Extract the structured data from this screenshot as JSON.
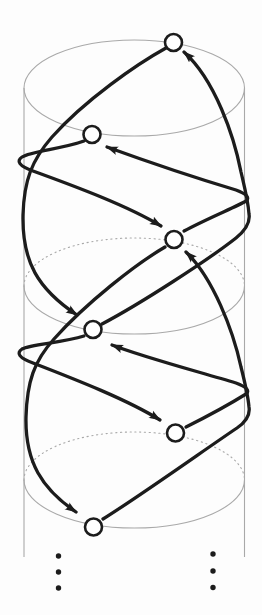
{
  "figure": {
    "width": 262,
    "height": 615,
    "background": "#fdfdfd",
    "colors": {
      "ink": "#1c1c1c",
      "node_fill": "#ffffff",
      "cylinder_line": "#a9a9a9"
    },
    "stroke": {
      "edge_width": 3.3,
      "node_stroke_width": 2.6,
      "node_radius": 8.5,
      "cylinder_width": 1.1,
      "dot_dash": "1.2 3.6"
    },
    "cylinder": {
      "left_wall": {
        "x": 24,
        "y1": 88,
        "y2": 557
      },
      "right_wall": {
        "x": 244.5,
        "y1": 88,
        "y2": 557
      },
      "rx": 110.25,
      "ry": 48,
      "cx": 134.25,
      "rings": [
        {
          "name": "top-rim",
          "cy": 88,
          "back": "solid",
          "front": "solid"
        },
        {
          "name": "middle-rim",
          "cy": 286,
          "back": "dotted",
          "front": "solid"
        },
        {
          "name": "bottom-rim",
          "cy": 480,
          "back": "dotted",
          "front": "solid"
        }
      ]
    },
    "nodes": [
      {
        "id": "n1",
        "x": 173.5,
        "y": 42.5,
        "face": "back"
      },
      {
        "id": "n2",
        "x": 92,
        "y": 134.5,
        "face": "front"
      },
      {
        "id": "n3",
        "x": 174,
        "y": 239.5,
        "face": "back"
      },
      {
        "id": "n4",
        "x": 93,
        "y": 329.5,
        "face": "front"
      },
      {
        "id": "n5",
        "x": 175.5,
        "y": 433,
        "face": "back"
      },
      {
        "id": "n6",
        "x": 93.5,
        "y": 527,
        "face": "front"
      }
    ],
    "edges": [
      {
        "id": "e-n2-n3",
        "from": "n2",
        "to": "n3",
        "wrap": "left-edge",
        "path": "M 84 141 C 62 149 31 151 22 157 C 16 161 19 166 33 171 C 77 187 128 206 161 226"
      },
      {
        "id": "e-n3-n2",
        "from": "n3",
        "to": "n2",
        "wrap": "right-edge",
        "path": "M 184 231 C 206 219 238 206 246 201 C 250 198 247 194 236 190 C 196 178 140 159 107 147"
      },
      {
        "id": "e-n4-n1",
        "from": "n4",
        "to": "n1",
        "wrap": "right-edge",
        "path": "M 102 324 C 140 304 208 260 236 238 C 247 229 250 220 249 214 C 248 200 244 185 241 172 C 234 136 215 80 184 52"
      },
      {
        "id": "e-n1-n4",
        "from": "n1",
        "to": "n4",
        "wrap": "none",
        "path": "M 166 48 C 137 64 85 100 52 137 C 32 160 24 180 23 215 C 22 262 38 289 77 315"
      },
      {
        "id": "e-n4-n5",
        "from": "n4",
        "to": "n5",
        "wrap": "left-edge",
        "path": "M 84 336 C 62 343 31 344 22 349 C 16 353 19 358 33 363 C 77 380 128 400 160 420"
      },
      {
        "id": "e-n5-n4",
        "from": "n5",
        "to": "n4",
        "wrap": "right-edge",
        "path": "M 186 427 C 208 416 238 399 246 394 C 250 391 247 387 236 383 C 196 371 143 357 112 345"
      },
      {
        "id": "e-n6-n3",
        "from": "n6",
        "to": "n3",
        "wrap": "right-edge",
        "path": "M 103 519 C 140 496 210 446 237 428 C 247 421 250 413 249 407 C 248 395 244 379 241 367 C 233 330 213 278 186 252"
      },
      {
        "id": "e-n3-n6",
        "from": "n3",
        "to": "n6",
        "wrap": "none",
        "path": "M 165 247 C 136 264 86 303 54 339 C 34 361 27 382 26 417 C 25 462 42 489 76 512"
      }
    ],
    "continuation_dots": {
      "radius": 2.7,
      "columns": [
        {
          "name": "left-ellipsis",
          "x": 58.5,
          "ys": [
            556,
            572,
            588
          ]
        },
        {
          "name": "right-ellipsis",
          "x": 213,
          "ys": [
            554,
            571,
            587.5
          ]
        }
      ]
    }
  }
}
